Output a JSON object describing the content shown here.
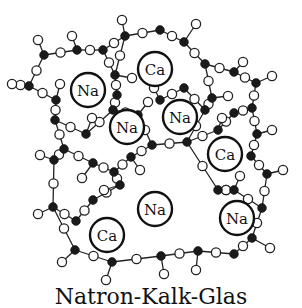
{
  "caption": "Natron-Kalk-Glas",
  "colors": {
    "silicon": "#1a1a1a",
    "oxygen": "#ffffff",
    "bond": "#222222",
    "ion_ring": "#111111"
  },
  "legend_implied": {
    "filled_circle": "silicon",
    "open_circle": "oxygen"
  },
  "ions": [
    {
      "label": "Na",
      "x": 88,
      "y": 90,
      "r": 17
    },
    {
      "label": "Ca",
      "x": 155,
      "y": 69,
      "r": 17
    },
    {
      "label": "Na",
      "x": 127,
      "y": 127,
      "r": 17
    },
    {
      "label": "Na",
      "x": 180,
      "y": 117,
      "r": 17
    },
    {
      "label": "Ca",
      "x": 225,
      "y": 154,
      "r": 17
    },
    {
      "label": "Na",
      "x": 155,
      "y": 209,
      "r": 17
    },
    {
      "label": "Ca",
      "x": 107,
      "y": 235,
      "r": 17
    },
    {
      "label": "Na",
      "x": 237,
      "y": 218,
      "r": 17
    }
  ],
  "silicons": [
    [
      44,
      54
    ],
    [
      77,
      50
    ],
    [
      103,
      50
    ],
    [
      125,
      36
    ],
    [
      158,
      60
    ],
    [
      138,
      115
    ],
    [
      115,
      75
    ],
    [
      117,
      95
    ],
    [
      29,
      86
    ],
    [
      56,
      100
    ],
    [
      113,
      110
    ],
    [
      100,
      132
    ],
    [
      86,
      134
    ],
    [
      160,
      63
    ],
    [
      184,
      42
    ],
    [
      205,
      64
    ],
    [
      205,
      75
    ],
    [
      234,
      113
    ],
    [
      218,
      107
    ],
    [
      252,
      108
    ],
    [
      257,
      134
    ],
    [
      226,
      89
    ],
    [
      256,
      83
    ],
    [
      64,
      149
    ],
    [
      54,
      160
    ],
    [
      93,
      163
    ],
    [
      131,
      157
    ],
    [
      114,
      172
    ],
    [
      53,
      207
    ],
    [
      76,
      221
    ],
    [
      155,
      186
    ],
    [
      120,
      185
    ],
    [
      187,
      185
    ],
    [
      146,
      227
    ],
    [
      202,
      216
    ],
    [
      218,
      190
    ],
    [
      251,
      156
    ],
    [
      267,
      174
    ],
    [
      262,
      208
    ],
    [
      252,
      238
    ],
    [
      161,
      256
    ],
    [
      198,
      251
    ],
    [
      234,
      254
    ],
    [
      112,
      262
    ],
    [
      75,
      250
    ]
  ],
  "network_note": "SiO4 tetrahedra network with Na+ and Ca2+ modifier ions"
}
